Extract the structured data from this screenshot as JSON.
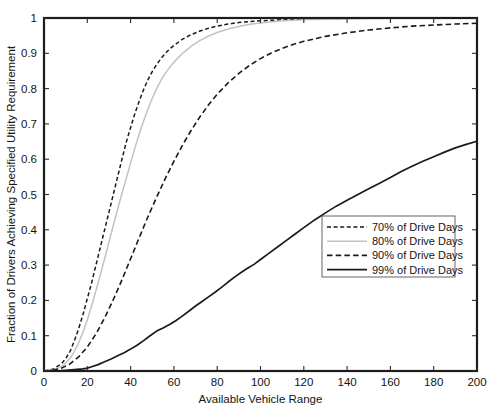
{
  "chart_data": {
    "type": "line",
    "title": "",
    "xlabel": "Available Vehicle Range",
    "ylabel": "Fraction of Drivers Achieving Specified Utility Requirement",
    "xlim": [
      0,
      200
    ],
    "ylim": [
      0,
      1
    ],
    "xticks": [
      0,
      20,
      40,
      60,
      80,
      100,
      120,
      140,
      160,
      180,
      200
    ],
    "xtick_labels": [
      "0",
      "20",
      "40",
      "60",
      "80",
      "100",
      "120",
      "140",
      "160",
      "180",
      "200"
    ],
    "yticks": [
      0,
      0.1,
      0.2,
      0.3,
      0.4,
      0.5,
      0.6,
      0.7,
      0.8,
      0.9,
      1
    ],
    "ytick_labels": [
      "0",
      "0.1",
      "0.2",
      "0.3",
      "0.4",
      "0.5",
      "0.6",
      "0.7",
      "0.8",
      "0.9",
      "1"
    ],
    "grid": false,
    "legend_position": "center-right",
    "series": [
      {
        "name": "70% of Drive Days",
        "label": "70% of Drive Days",
        "color": "#1a1a1a",
        "style": "dashed-short",
        "dasharray": "4,2.6",
        "width": 1.5,
        "x": [
          0,
          4,
          8,
          10,
          12,
          14,
          16,
          18,
          20,
          22,
          24,
          26,
          28,
          30,
          32,
          34,
          36,
          38,
          40,
          42,
          44,
          46,
          48,
          50,
          52,
          54,
          56,
          58,
          60,
          64,
          68,
          72,
          76,
          80,
          85,
          90,
          95,
          100,
          110,
          120,
          140,
          160,
          180,
          200
        ],
        "y": [
          0,
          0.005,
          0.02,
          0.035,
          0.055,
          0.085,
          0.12,
          0.16,
          0.205,
          0.25,
          0.3,
          0.35,
          0.4,
          0.45,
          0.5,
          0.55,
          0.6,
          0.648,
          0.69,
          0.73,
          0.765,
          0.797,
          0.825,
          0.848,
          0.868,
          0.885,
          0.9,
          0.912,
          0.922,
          0.94,
          0.953,
          0.963,
          0.971,
          0.977,
          0.983,
          0.987,
          0.99,
          0.992,
          0.995,
          0.997,
          0.999,
          1.0,
          1.0,
          1.0
        ]
      },
      {
        "name": "80% of Drive Days",
        "label": "80% of Drive Days",
        "color": "#c2c2c2",
        "style": "solid-light",
        "dasharray": "none",
        "width": 1.5,
        "x": [
          0,
          4,
          8,
          10,
          12,
          14,
          16,
          18,
          20,
          22,
          24,
          26,
          28,
          30,
          32,
          34,
          36,
          38,
          40,
          42,
          44,
          46,
          48,
          50,
          52,
          54,
          56,
          58,
          60,
          64,
          68,
          72,
          76,
          80,
          85,
          90,
          95,
          100,
          110,
          120,
          140,
          160,
          180,
          200
        ],
        "y": [
          0,
          0.003,
          0.012,
          0.022,
          0.036,
          0.055,
          0.08,
          0.11,
          0.145,
          0.185,
          0.228,
          0.272,
          0.318,
          0.365,
          0.412,
          0.458,
          0.503,
          0.545,
          0.59,
          0.632,
          0.672,
          0.708,
          0.742,
          0.772,
          0.8,
          0.823,
          0.843,
          0.86,
          0.875,
          0.9,
          0.92,
          0.936,
          0.949,
          0.959,
          0.969,
          0.976,
          0.982,
          0.986,
          0.992,
          0.995,
          0.998,
          0.999,
          1.0,
          1.0
        ]
      },
      {
        "name": "90% of Drive Days",
        "label": "90% of Drive Days",
        "color": "#1a1a1a",
        "style": "dashed-long",
        "dasharray": "5.5,3.2",
        "width": 1.6,
        "x": [
          0,
          4,
          8,
          12,
          16,
          20,
          24,
          28,
          32,
          36,
          40,
          44,
          48,
          52,
          56,
          60,
          64,
          68,
          72,
          76,
          80,
          85,
          90,
          95,
          100,
          105,
          110,
          115,
          120,
          130,
          140,
          150,
          160,
          170,
          180,
          190,
          200
        ],
        "y": [
          0,
          0.002,
          0.008,
          0.02,
          0.04,
          0.068,
          0.105,
          0.15,
          0.202,
          0.258,
          0.318,
          0.378,
          0.437,
          0.492,
          0.545,
          0.594,
          0.64,
          0.682,
          0.72,
          0.754,
          0.784,
          0.816,
          0.843,
          0.866,
          0.885,
          0.901,
          0.914,
          0.925,
          0.934,
          0.948,
          0.958,
          0.966,
          0.972,
          0.977,
          0.98,
          0.983,
          0.985
        ]
      },
      {
        "name": "99% of Drive Days",
        "label": "99% of Drive Days",
        "color": "#1a1a1a",
        "style": "solid",
        "dasharray": "none",
        "width": 1.7,
        "x": [
          0,
          5,
          10,
          14,
          18,
          20,
          22,
          25,
          28,
          31,
          34,
          37,
          40,
          43,
          46,
          49,
          52,
          55,
          58,
          61,
          64,
          67,
          70,
          73,
          76,
          79,
          82,
          85,
          88,
          91,
          94,
          97,
          100,
          104,
          108,
          112,
          116,
          120,
          125,
          130,
          135,
          140,
          145,
          150,
          155,
          160,
          165,
          170,
          175,
          180,
          185,
          190,
          195,
          200
        ],
        "y": [
          0,
          0.0,
          0.002,
          0.004,
          0.006,
          0.008,
          0.012,
          0.018,
          0.026,
          0.034,
          0.043,
          0.052,
          0.062,
          0.073,
          0.086,
          0.1,
          0.113,
          0.122,
          0.132,
          0.143,
          0.156,
          0.17,
          0.184,
          0.197,
          0.21,
          0.223,
          0.237,
          0.252,
          0.266,
          0.279,
          0.291,
          0.302,
          0.316,
          0.334,
          0.352,
          0.37,
          0.388,
          0.406,
          0.428,
          0.448,
          0.467,
          0.484,
          0.5,
          0.516,
          0.532,
          0.548,
          0.565,
          0.58,
          0.594,
          0.607,
          0.62,
          0.632,
          0.642,
          0.651
        ]
      }
    ]
  }
}
